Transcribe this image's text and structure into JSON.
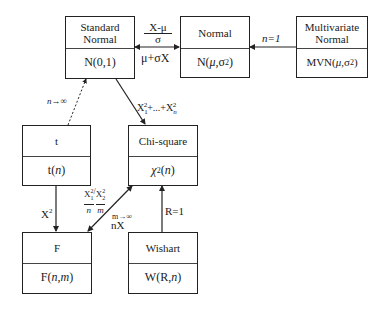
{
  "diagram": {
    "type": "distribution-relationships",
    "nodes": [
      {
        "id": "standard-normal",
        "name": "Standard Normal",
        "name_line1": "Standard",
        "name_line2": "Normal",
        "notation": "N(0,1)"
      },
      {
        "id": "normal",
        "name": "Normal",
        "notation": "N(μ,σ²)"
      },
      {
        "id": "multivariate-normal",
        "name": "Multivariate Normal",
        "name_line1": "Multivariate",
        "name_line2": "Normal",
        "notation": "MVN(μ,σ²)"
      },
      {
        "id": "t",
        "name": "t",
        "notation": "t(n)"
      },
      {
        "id": "chi-square",
        "name": "Chi-square",
        "notation": "χ²(n)"
      },
      {
        "id": "f",
        "name": "F",
        "notation": "F(n,m)"
      },
      {
        "id": "wishart",
        "name": "Wishart",
        "notation": "W(R, n)"
      }
    ],
    "edges": [
      {
        "from": "normal",
        "to": "standard-normal",
        "label": "(X-μ)/σ",
        "label_num": "X-μ",
        "label_den": "σ"
      },
      {
        "from": "standard-normal",
        "to": "normal",
        "label": "μ+σX"
      },
      {
        "from": "multivariate-normal",
        "to": "normal",
        "label": "n=1"
      },
      {
        "from": "t",
        "to": "standard-normal",
        "label": "n→∞",
        "style": "dashed"
      },
      {
        "from": "standard-normal",
        "to": "chi-square",
        "label": "X₁²+...+Xₙ²"
      },
      {
        "from": "t",
        "to": "f",
        "label": "X²"
      },
      {
        "from": "chi-square",
        "to": "f",
        "label": "(X₁²/n)/(X₂²/m)"
      },
      {
        "from": "f",
        "to": "chi-square",
        "label": "m→∞ nX"
      },
      {
        "from": "wishart",
        "to": "chi-square",
        "label": "R=1"
      }
    ]
  },
  "labels": {
    "std_norm_line1": "Standard",
    "std_norm_line2": "Normal",
    "std_norm_notation": "N(0,1)",
    "normal_name": "Normal",
    "mvn_line1": "Multivariate",
    "mvn_line2": "Normal",
    "t_name": "t",
    "chi_name": "Chi-square",
    "f_name": "F",
    "wishart_name": "Wishart",
    "edge_standardize_num": "X-μ",
    "edge_standardize_den": "σ",
    "edge_destandardize": "μ+σX",
    "edge_n1": "n=1",
    "edge_t_limit": "n→∞",
    "edge_x2": "X",
    "edge_r1": "R=1",
    "edge_m_limit": "m→∞",
    "edge_nx": "nX",
    "sup2": "2",
    "sub1": "1",
    "subn": "n",
    "sub2": "2",
    "plus_dots": "+...+"
  }
}
